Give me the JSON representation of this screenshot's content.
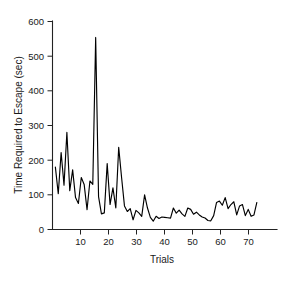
{
  "chart_data": {
    "type": "line",
    "title": "",
    "xlabel": "Trials",
    "ylabel": "Time Required to Escape (sec)",
    "xlim": [
      0,
      78
    ],
    "ylim": [
      0,
      600
    ],
    "grid": false,
    "legend": null,
    "xticks": [
      10,
      20,
      30,
      40,
      50,
      60,
      70
    ],
    "yticks": [
      0,
      100,
      200,
      300,
      400,
      500,
      600
    ],
    "line_color": "#000000",
    "series": [
      {
        "name": "escape-latency",
        "x": [
          1,
          2,
          3,
          4,
          5,
          6,
          7,
          8,
          9,
          10,
          11,
          12,
          13,
          14,
          15,
          16,
          17,
          18,
          19,
          20,
          21,
          22,
          23,
          24,
          25,
          26,
          27,
          28,
          29,
          30,
          31,
          32,
          33,
          34,
          35,
          36,
          37,
          38,
          39,
          40,
          41,
          42,
          43,
          44,
          45,
          46,
          47,
          48,
          49,
          50,
          51,
          52,
          53,
          54,
          55,
          56,
          57,
          58,
          59,
          60,
          61,
          62,
          63,
          64,
          65,
          66,
          67,
          68,
          69,
          70,
          71
        ],
        "values": [
          180,
          103,
          222,
          128,
          280,
          112,
          172,
          92,
          75,
          150,
          130,
          57,
          140,
          130,
          554,
          95,
          45,
          48,
          190,
          72,
          120,
          62,
          237,
          150,
          68,
          52,
          60,
          28,
          55,
          48,
          38,
          100,
          62,
          35,
          24,
          38,
          32,
          36,
          35,
          34,
          33,
          62,
          47,
          56,
          45,
          38,
          62,
          58,
          44,
          50,
          42,
          36,
          33,
          26,
          25,
          40,
          78,
          82,
          70,
          92,
          60,
          72,
          80,
          42,
          68,
          72,
          40,
          58,
          38,
          42,
          78
        ]
      }
    ]
  }
}
